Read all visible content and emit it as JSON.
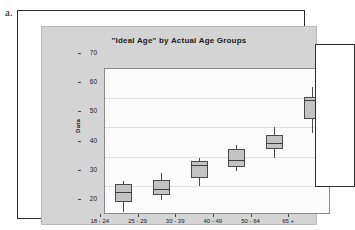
{
  "figure": {
    "label": "a."
  },
  "chart_data": {
    "type": "box",
    "title": "\"Ideal Age\"  by Actual Age Groups",
    "xlabel": "",
    "ylabel": "Data",
    "ylim": [
      20,
      70
    ],
    "yticks": [
      20,
      30,
      40,
      50,
      60,
      70
    ],
    "grid": true,
    "legend": null,
    "categories": [
      "18 - 24",
      "25 - 29",
      "30 - 39",
      "40 - 49",
      "50 - 64",
      "65 +"
    ],
    "boxes": [
      {
        "category": "18 - 24",
        "whisker_low": 21.0,
        "q1": 24.5,
        "median": 28.0,
        "q3": 30.5,
        "whisker_high": 31.5
      },
      {
        "category": "25 - 29",
        "whisker_low": 25.0,
        "q1": 27.0,
        "median": 29.0,
        "q3": 32.0,
        "whisker_high": 34.5
      },
      {
        "category": "30 - 39",
        "whisker_low": 30.0,
        "q1": 32.5,
        "median": 37.0,
        "q3": 38.5,
        "whisker_high": 39.5
      },
      {
        "category": "40 - 49",
        "whisker_low": 35.0,
        "q1": 36.5,
        "median": 39.0,
        "q3": 42.5,
        "whisker_high": 44.0
      },
      {
        "category": "50 - 64",
        "whisker_low": 39.5,
        "q1": 42.5,
        "median": 44.5,
        "q3": 47.5,
        "whisker_high": 50.0
      },
      {
        "category": "65 +",
        "whisker_low": 48.0,
        "q1": 53.0,
        "median": 59.5,
        "q3": 60.5,
        "whisker_high": 64.0
      }
    ]
  },
  "colors": {
    "panel_background": "#d4d4d4",
    "plot_background": "#fcfcfc",
    "box_fill": "#c3c3c3",
    "box_outline": "#4a4a4a",
    "gridline": "#e2e2e2"
  }
}
